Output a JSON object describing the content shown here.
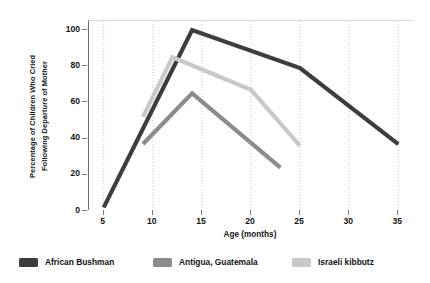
{
  "axes": {
    "ylabel_line1": "Percentage of Children Who Cried",
    "ylabel_line2": "Following Departure of Mother",
    "xlabel": "Age (months)",
    "yticks": [
      "0",
      "20",
      "40",
      "60",
      "80",
      "100"
    ],
    "xticks": [
      "5",
      "10",
      "15",
      "20",
      "25",
      "30",
      "35"
    ]
  },
  "legend": {
    "items": [
      {
        "label": "African Bushman",
        "color": "#3d3d3d"
      },
      {
        "label": "Antigua, Guatemala",
        "color": "#8c8c8c"
      },
      {
        "label": "Israeli kibbutz",
        "color": "#c9c9c9"
      }
    ]
  },
  "chart_data": {
    "type": "line",
    "title": "",
    "xlabel": "Age (months)",
    "ylabel": "Percentage of Children Who Cried Following Departure of Mother",
    "xlim": [
      3.5,
      36.5
    ],
    "ylim": [
      0,
      105
    ],
    "xticks": [
      5,
      10,
      15,
      20,
      25,
      30,
      35
    ],
    "yticks": [
      0,
      20,
      40,
      60,
      80,
      100
    ],
    "grid": "vertical-dotted",
    "legend_position": "below",
    "series": [
      {
        "name": "African Bushman",
        "color": "#3d3d3d",
        "x": [
          5,
          14,
          25,
          35
        ],
        "y": [
          2,
          100,
          79,
          37
        ]
      },
      {
        "name": "Antigua, Guatemala",
        "color": "#8c8c8c",
        "x": [
          9,
          14,
          23
        ],
        "y": [
          37,
          65,
          24
        ]
      },
      {
        "name": "Israeli kibbutz",
        "color": "#c9c9c9",
        "x": [
          9,
          12,
          20,
          25
        ],
        "y": [
          52,
          85,
          67,
          36
        ]
      }
    ]
  }
}
